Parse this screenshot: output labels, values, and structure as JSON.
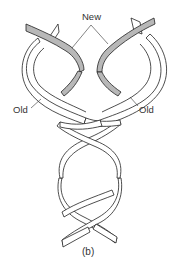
{
  "figure": {
    "labels": {
      "new": "New",
      "old_left": "Old",
      "old_right": "Old"
    },
    "caption": "(b)",
    "colors": {
      "new_strand": "#b8b8b8",
      "old_strand": "#ffffff",
      "outline": "#222222"
    }
  }
}
